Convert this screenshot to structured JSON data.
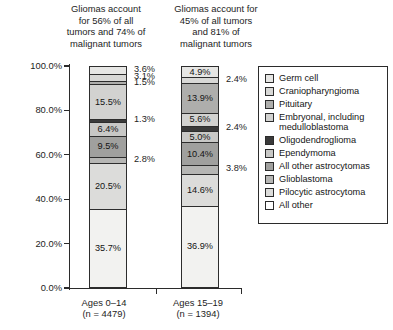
{
  "chart_data": {
    "type": "bar",
    "subtype": "stacked-bar-100pct",
    "title": "",
    "xlabel": "",
    "ylabel": "",
    "ylim": [
      0,
      100
    ],
    "ytick_labels": [
      "0.0%",
      "20.0%",
      "40.0%",
      "60.0%",
      "80.0%",
      "100.0%"
    ],
    "ytick_values": [
      0,
      20,
      40,
      60,
      80,
      100
    ],
    "grid": false,
    "legend_position": "right",
    "categories": [
      "Ages 0–14\n(n = 4479)",
      "Ages 15–19\n(n = 1394)"
    ],
    "annotations": [
      "Gliomas account for 56% of all tumors and 74% of malignant tumors",
      "Gliomas account for 45% of all tumors and 81% of malignant tumors"
    ],
    "series": [
      {
        "name": "All other",
        "color": "#f2f2f0",
        "values": [
          35.7,
          36.9
        ]
      },
      {
        "name": "Pilocytic astrocytoma",
        "color": "#dcdcda",
        "values": [
          20.5,
          14.6
        ]
      },
      {
        "name": "Glioblastoma",
        "color": "#b6b6b4",
        "values": [
          2.8,
          3.8
        ]
      },
      {
        "name": "All other astrocytomas",
        "color": "#a0a09e",
        "values": [
          9.5,
          10.4
        ]
      },
      {
        "name": "Ependymoma",
        "color": "#c8c8c6",
        "values": [
          6.4,
          5.0
        ]
      },
      {
        "name": "Oligodendroglioma",
        "color": "#3a3a3a",
        "values": [
          1.3,
          2.4
        ]
      },
      {
        "name": "Embryonal, including\nmedulloblastoma",
        "color": "#d2d2d0",
        "values": [
          15.5,
          5.6
        ]
      },
      {
        "name": "Pituitary",
        "color": "#aeaeac",
        "values": [
          1.5,
          13.9
        ]
      },
      {
        "name": "Craniopharyngioma",
        "color": "#d8d8d6",
        "values": [
          3.1,
          2.4
        ]
      },
      {
        "name": "Germ cell",
        "color": "#e6e6e4",
        "values": [
          3.6,
          4.9
        ]
      }
    ]
  },
  "headers": {
    "left": "Gliomas account\nfor 56% of all\ntumors and 74% of\nmalignant tumors",
    "right": "Gliomas account for\n45% of all tumors\nand 81% of\nmalignant tumors"
  },
  "yaxis": {
    "ticks": [
      {
        "label": "100.0%",
        "value": 100
      },
      {
        "label": "80.0%",
        "value": 80
      },
      {
        "label": "60.0%",
        "value": 60
      },
      {
        "label": "40.0%",
        "value": 40
      },
      {
        "label": "20.0%",
        "value": 20
      },
      {
        "label": "0.0%",
        "value": 0
      }
    ]
  },
  "bars": [
    {
      "id": "bar1",
      "xlabel": "Ages 0–14\n(n = 4479)",
      "segments": [
        {
          "name": "Germ cell",
          "label": "3.6%",
          "value": 3.6,
          "color": "#e6e6e4",
          "inside": false
        },
        {
          "name": "Craniopharyngioma",
          "label": "3.1%",
          "value": 3.1,
          "color": "#d8d8d6",
          "inside": false
        },
        {
          "name": "Pituitary",
          "label": "1.5%",
          "value": 1.5,
          "color": "#aeaeac",
          "inside": false
        },
        {
          "name": "Embryonal",
          "label": "15.5%",
          "value": 15.5,
          "color": "#d2d2d0",
          "inside": true
        },
        {
          "name": "Oligodendroglioma",
          "label": "1.3%",
          "value": 1.3,
          "color": "#3a3a3a",
          "inside": false
        },
        {
          "name": "Ependymoma",
          "label": "6.4%",
          "value": 6.4,
          "color": "#c8c8c6",
          "inside": true
        },
        {
          "name": "All other astrocytomas",
          "label": "9.5%",
          "value": 9.5,
          "color": "#a0a09e",
          "inside": true
        },
        {
          "name": "Glioblastoma",
          "label": "2.8%",
          "value": 2.8,
          "color": "#b6b6b4",
          "inside": false
        },
        {
          "name": "Pilocytic astrocytoma",
          "label": "20.5%",
          "value": 20.5,
          "color": "#dcdcda",
          "inside": true
        },
        {
          "name": "All other",
          "label": "35.7%",
          "value": 35.7,
          "color": "#f2f2f0",
          "inside": true
        }
      ]
    },
    {
      "id": "bar2",
      "xlabel": "Ages 15–19\n(n = 1394)",
      "segments": [
        {
          "name": "Germ cell",
          "label": "4.9%",
          "value": 4.9,
          "color": "#e6e6e4",
          "inside": true
        },
        {
          "name": "Craniopharyngioma",
          "label": "2.4%",
          "value": 2.4,
          "color": "#d8d8d6",
          "inside": false
        },
        {
          "name": "Pituitary",
          "label": "13.9%",
          "value": 13.9,
          "color": "#aeaeac",
          "inside": true
        },
        {
          "name": "Embryonal",
          "label": "5.6%",
          "value": 5.6,
          "color": "#d2d2d0",
          "inside": true
        },
        {
          "name": "Oligodendroglioma",
          "label": "2.4%",
          "value": 2.4,
          "color": "#3a3a3a",
          "inside": false
        },
        {
          "name": "Ependymoma",
          "label": "5.0%",
          "value": 5.0,
          "color": "#c8c8c6",
          "inside": true
        },
        {
          "name": "All other astrocytomas",
          "label": "10.4%",
          "value": 10.4,
          "color": "#a0a09e",
          "inside": true
        },
        {
          "name": "Glioblastoma",
          "label": "3.8%",
          "value": 3.8,
          "color": "#b6b6b4",
          "inside": false
        },
        {
          "name": "Pilocytic astrocytoma",
          "label": "14.6%",
          "value": 14.6,
          "color": "#dcdcda",
          "inside": true
        },
        {
          "name": "All other",
          "label": "36.9%",
          "value": 36.9,
          "color": "#f2f2f0",
          "inside": true
        }
      ]
    }
  ],
  "legend": {
    "items": [
      {
        "label": "Germ cell",
        "color": "#e6e6e4"
      },
      {
        "label": "Craniopharyngioma",
        "color": "#d8d8d6"
      },
      {
        "label": "Pituitary",
        "color": "#aeaeac"
      },
      {
        "label": "Embryonal, including\n  medulloblastoma",
        "color": "#d2d2d0"
      },
      {
        "label": "Oligodendroglioma",
        "color": "#3a3a3a"
      },
      {
        "label": "Ependymoma",
        "color": "#c8c8c6"
      },
      {
        "label": "All other astrocytomas",
        "color": "#a0a09e"
      },
      {
        "label": "Glioblastoma",
        "color": "#b6b6b4"
      },
      {
        "label": "Pilocytic astrocytoma",
        "color": "#dcdcda"
      },
      {
        "label": "All other",
        "color": "#ffffff"
      }
    ]
  }
}
